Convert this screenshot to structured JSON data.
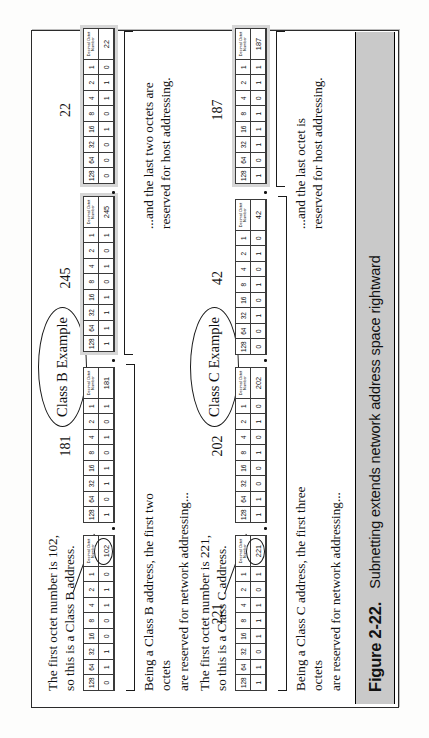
{
  "figure": {
    "caption_number": "Figure 2-22.",
    "caption_text": "Subnetting extends network address space rightward"
  },
  "bit_headers": [
    "128",
    "64",
    "32",
    "16",
    "8",
    "4",
    "2",
    "1"
  ],
  "decimal_header_line1": "Decimal Octet",
  "decimal_header_line2": "Number",
  "examples": [
    {
      "id": "class-b",
      "ellipse_label": "Class B Example",
      "note_top": "The first octet number is 102,\nso this is a Class B address.",
      "note_network": "Being a Class B address, the first two octets\nare reserved for network addressing...",
      "note_host": "...and the last two octets are\nreserved for host addressing.",
      "octets": [
        {
          "label": "",
          "decimal": "102",
          "bits": [
            "0",
            "1",
            "1",
            "0",
            "0",
            "1",
            "1",
            "0"
          ],
          "shaded": false,
          "circled": true
        },
        {
          "label": "181",
          "decimal": "181",
          "bits": [
            "1",
            "0",
            "1",
            "1",
            "0",
            "1",
            "0",
            "1"
          ],
          "shaded": false,
          "circled": false
        },
        {
          "label": "245",
          "decimal": "245",
          "bits": [
            "1",
            "1",
            "1",
            "1",
            "0",
            "1",
            "0",
            "1"
          ],
          "shaded": true,
          "circled": false
        },
        {
          "label": "22",
          "decimal": "22",
          "bits": [
            "0",
            "0",
            "0",
            "1",
            "0",
            "1",
            "1",
            "0"
          ],
          "shaded": true,
          "circled": false
        }
      ]
    },
    {
      "id": "class-c",
      "ellipse_label": "Class C Example",
      "note_top": "The first octet number is 221,\nso this is a Class C address.",
      "note_network": "Being a Class C address, the first three octets\nare reserved for network addressing...",
      "note_host": "...and the last octet is\nreserved for host addressing.",
      "octets": [
        {
          "label": "221",
          "decimal": "221",
          "bits": [
            "1",
            "1",
            "0",
            "1",
            "1",
            "1",
            "0",
            "1"
          ],
          "shaded": false,
          "circled": true
        },
        {
          "label": "202",
          "decimal": "202",
          "bits": [
            "1",
            "1",
            "0",
            "0",
            "1",
            "0",
            "1",
            "0"
          ],
          "shaded": false,
          "circled": false
        },
        {
          "label": "42",
          "decimal": "42",
          "bits": [
            "0",
            "0",
            "1",
            "0",
            "1",
            "0",
            "1",
            "0"
          ],
          "shaded": false,
          "circled": false
        },
        {
          "label": "187",
          "decimal": "187",
          "bits": [
            "1",
            "0",
            "1",
            "1",
            "1",
            "0",
            "1",
            "1"
          ],
          "shaded": true,
          "circled": false
        }
      ]
    }
  ]
}
